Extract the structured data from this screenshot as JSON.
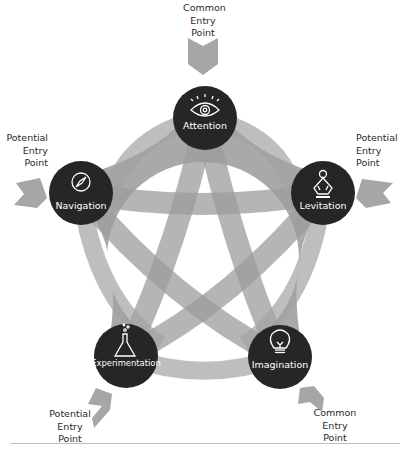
{
  "diagram": {
    "title": "",
    "colors": {
      "band": "#a9a9a9",
      "band_overlap": "#8e8e8e",
      "node_fill": "#262626",
      "node_text": "#ffffff",
      "arrow": "#a6a6a6",
      "label_text": "#2a2a2a",
      "rule": "#bdbdbd"
    },
    "nodes": [
      {
        "id": "attention",
        "label": "Attention",
        "icon": "eye-icon",
        "cx": 205,
        "cy": 118
      },
      {
        "id": "levitation",
        "label": "Levitation",
        "icon": "meditation-icon",
        "cx": 323,
        "cy": 193
      },
      {
        "id": "imagination",
        "label": "Imagination",
        "icon": "lightbulb-icon",
        "cx": 280,
        "cy": 357
      },
      {
        "id": "experimentation",
        "label": "Experimentation",
        "icon": "flask-icon",
        "cx": 126,
        "cy": 356
      },
      {
        "id": "navigation",
        "label": "Navigation",
        "icon": "compass-icon",
        "cx": 81,
        "cy": 193
      }
    ],
    "entry_points": [
      {
        "target": "attention",
        "type": "common",
        "label": "Common\nEntry\nPoint"
      },
      {
        "target": "levitation",
        "type": "potential",
        "label": "Potential\nEntry\nPoint"
      },
      {
        "target": "imagination",
        "type": "common",
        "label": "Common\nEntry\nPoint"
      },
      {
        "target": "experimentation",
        "type": "potential",
        "label": "Potential\nEntry\nPoint"
      },
      {
        "target": "navigation",
        "type": "potential",
        "label": "Potential\nEntry\nPoint"
      }
    ]
  }
}
